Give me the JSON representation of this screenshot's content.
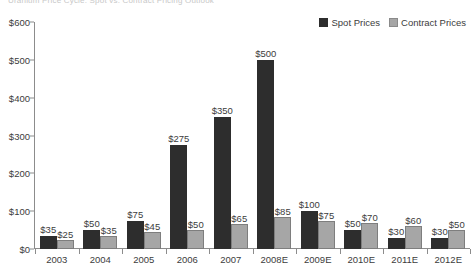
{
  "clipped_title": "Uranium Price Cycle: Spot vs. Contract Pricing Outlook",
  "legend": {
    "position": "top-right",
    "entries": [
      {
        "label": "Spot Prices",
        "color": "#2d2d2d",
        "icon": "legend-swatch-icon"
      },
      {
        "label": "Contract Prices",
        "color": "#a6a6a6",
        "icon": "legend-swatch-icon"
      }
    ]
  },
  "chart_data": {
    "type": "bar",
    "title": "",
    "xlabel": "",
    "ylabel": "",
    "grid": false,
    "legend_position": "top-right",
    "ylim": [
      0,
      600
    ],
    "yticks": [
      0,
      100,
      200,
      300,
      400,
      500,
      600
    ],
    "ytick_labels": [
      "$0",
      "$100",
      "$200",
      "$300",
      "$400",
      "$500",
      "$600"
    ],
    "categories": [
      "2003",
      "2004",
      "2005",
      "2006",
      "2007",
      "2008E",
      "2009E",
      "2010E",
      "2011E",
      "2012E"
    ],
    "series": [
      {
        "name": "Spot Prices",
        "color": "#2d2d2d",
        "values": [
          35,
          50,
          75,
          275,
          350,
          500,
          100,
          50,
          30,
          30
        ],
        "data_labels": [
          "$35",
          "$50",
          "$75",
          "$275",
          "$350",
          "$500",
          "$100",
          "$50",
          "$30",
          "$30"
        ]
      },
      {
        "name": "Contract Prices",
        "color": "#a6a6a6",
        "values": [
          25,
          35,
          45,
          50,
          65,
          85,
          75,
          70,
          60,
          50
        ],
        "data_labels": [
          "$25",
          "$35",
          "$45",
          "$50",
          "$65",
          "$85",
          "$75",
          "$70",
          "$60",
          "$50"
        ]
      }
    ]
  }
}
